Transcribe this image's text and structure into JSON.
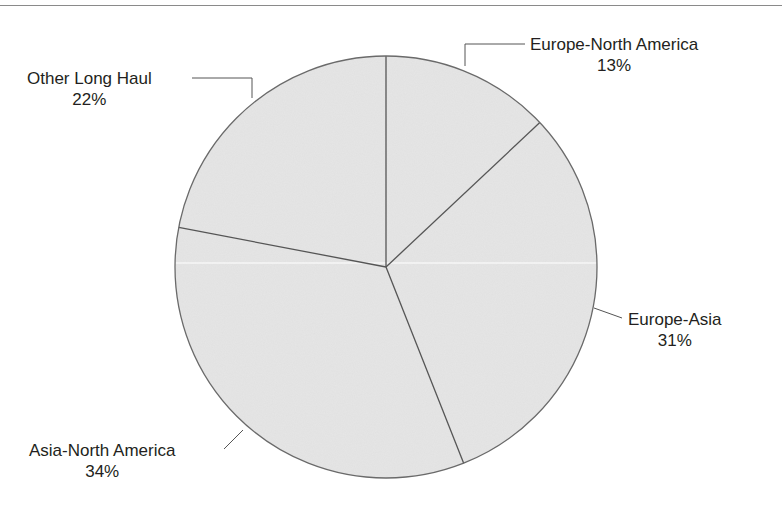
{
  "chart_data": {
    "type": "pie",
    "title": "",
    "start_angle_deg": 0,
    "direction": "clockwise",
    "slices": [
      {
        "label": "Europe-North America",
        "value": 13,
        "pct_label": "13%"
      },
      {
        "label": "Europe-Asia",
        "value": 31,
        "pct_label": "31%"
      },
      {
        "label": "Asia-North America",
        "value": 34,
        "pct_label": "34%"
      },
      {
        "label": "Other Long Haul",
        "value": 22,
        "pct_label": "22%"
      }
    ],
    "legend": "none",
    "labels": "outside with leader lines",
    "fill_color": "#e6e6e6",
    "stroke_color": "#555555"
  },
  "labels": {
    "europe_na": {
      "name": "Europe-North America",
      "pct": "13%"
    },
    "europe_asia": {
      "name": "Europe-Asia",
      "pct": "31%"
    },
    "asia_na": {
      "name": "Asia-North America",
      "pct": "34%"
    },
    "other": {
      "name": "Other Long Haul",
      "pct": "22%"
    }
  }
}
